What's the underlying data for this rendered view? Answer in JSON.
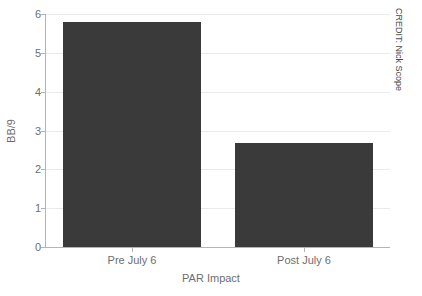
{
  "credit": "CREDIT: Nick Scope",
  "chart_data": {
    "type": "bar",
    "title": "",
    "xlabel": "PAR Impact",
    "ylabel": "BB/9",
    "categories": [
      "Pre July 6",
      "Post July 6"
    ],
    "values": [
      5.8,
      2.67
    ],
    "ylim": [
      0,
      6
    ],
    "yticks": [
      0,
      1,
      2,
      3,
      4,
      5,
      6
    ],
    "ytick_labels": [
      "0",
      "1",
      "2",
      "3",
      "4",
      "5",
      "6"
    ],
    "grid": true,
    "legend": false,
    "bar_color": "#3a3a3a",
    "grid_color": "#e9e9e9",
    "axis_color": "#b4b4b4",
    "text_color": "#6e6e6e",
    "background": "#ffffff"
  }
}
